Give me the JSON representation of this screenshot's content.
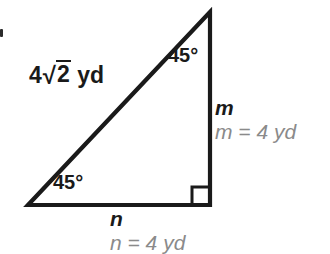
{
  "figure": {
    "type": "right-triangle-45-45-90",
    "background_color": "#ffffff",
    "stroke_color": "#1a1a1a",
    "label_color": "#1a1a1a",
    "answer_color": "#8a8a8a",
    "vertices": {
      "apex": [
        210,
        12
      ],
      "bottom_left": [
        28,
        205
      ],
      "bottom_right": [
        210,
        205
      ]
    },
    "right_angle_marker_at": "bottom_right"
  },
  "labels": {
    "hypotenuse": {
      "coefficient": "4",
      "radical_sign": "√",
      "radicand": "2",
      "unit": "yd"
    },
    "angle_top": "45°",
    "angle_bottom_left": "45°",
    "side_vertical": "m",
    "side_horizontal": "n"
  },
  "answers": {
    "m": "m = 4 yd",
    "n": "n = 4 yd"
  }
}
